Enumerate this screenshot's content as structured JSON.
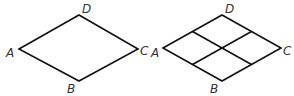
{
  "figures": [
    {
      "name": "rhombus-plain",
      "vertices": {
        "A": {
          "label": "A",
          "x": 19,
          "y": 49
        },
        "D": {
          "label": "D",
          "x": 79,
          "y": 15
        },
        "C": {
          "label": "C",
          "x": 138,
          "y": 49
        },
        "B": {
          "label": "B",
          "x": 79,
          "y": 81
        }
      }
    },
    {
      "name": "rhombus-divided",
      "vertices": {
        "A": {
          "label": "A",
          "x": 163,
          "y": 48
        },
        "D": {
          "label": "D",
          "x": 222,
          "y": 15
        },
        "C": {
          "label": "C",
          "x": 281,
          "y": 48
        },
        "B": {
          "label": "B",
          "x": 222,
          "y": 81
        }
      },
      "divisions": "midpoint lines joining opposite side midpoints, forming 4 smaller rhombi"
    }
  ],
  "colors": {
    "stroke": "#111111",
    "label": "#333333",
    "background": "#ffffff"
  }
}
